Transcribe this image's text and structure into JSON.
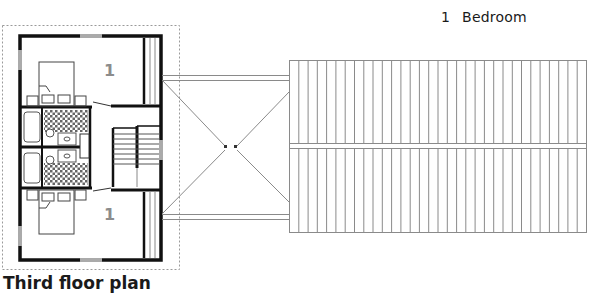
{
  "legend": {
    "items": [
      {
        "number": "1",
        "label": "Bedroom"
      }
    ]
  },
  "plan": {
    "title": "Third floor plan",
    "room_labels": [
      {
        "number": "1",
        "room": "upper-bedroom"
      },
      {
        "number": "1",
        "room": "lower-bedroom"
      }
    ],
    "roof_slat_count": 32
  },
  "colors": {
    "wall": "#111111",
    "line": "#8a8a8a",
    "label": "#8c8c8c",
    "tile": "#555555"
  }
}
